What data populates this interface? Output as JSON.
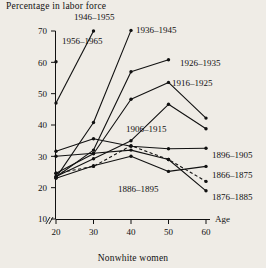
{
  "chart_data": {
    "type": "line",
    "title": "Percentage in labor force",
    "xlabel": "Age",
    "ylabel": "Percentage in labor force",
    "footer": "Nonwhite women",
    "x": [
      20,
      30,
      40,
      50,
      60
    ],
    "xlim": [
      20,
      60
    ],
    "ylim": [
      10,
      70
    ],
    "xticks": [
      20,
      30,
      40,
      50,
      60
    ],
    "yticks": [
      10,
      20,
      30,
      40,
      50,
      60,
      70
    ],
    "xtick_labels": [
      "20",
      "30",
      "40",
      "50",
      "60"
    ],
    "ytick_labels": [
      "10",
      "20",
      "30",
      "40",
      "50",
      "60",
      "70"
    ],
    "grid": false,
    "legend_position": "inline-annotations",
    "axis_break": true,
    "series": [
      {
        "name": "1956–1965",
        "x": [
          20
        ],
        "values": [
          60.2
        ],
        "style": "solid"
      },
      {
        "name": "1946–1955",
        "x": [
          20,
          30
        ],
        "values": [
          47.0,
          70.0
        ],
        "style": "solid"
      },
      {
        "name": "1936–1945",
        "x": [
          20,
          30,
          40
        ],
        "values": [
          23.2,
          40.8,
          70.2
        ],
        "style": "solid"
      },
      {
        "name": "1926–1935",
        "x": [
          20,
          30,
          40,
          50
        ],
        "values": [
          23.4,
          32.0,
          57.0,
          60.8
        ],
        "style": "solid"
      },
      {
        "name": "1916–1925",
        "x": [
          20,
          30,
          40,
          50,
          60
        ],
        "values": [
          24.6,
          30.8,
          48.2,
          53.6,
          42.2
        ],
        "style": "solid"
      },
      {
        "name": "1906–1915",
        "x": [
          20,
          30,
          40,
          50,
          60
        ],
        "values": [
          23.6,
          29.2,
          35.0,
          46.6,
          38.8
        ],
        "style": "solid"
      },
      {
        "name": "1896–1905",
        "x": [
          20,
          30,
          40,
          50,
          60
        ],
        "values": [
          31.6,
          35.6,
          33.2,
          32.4,
          32.6
        ],
        "style": "solid"
      },
      {
        "name": "1886–1895",
        "x": [
          20,
          30,
          40,
          50,
          60
        ],
        "values": [
          24.6,
          26.8,
          33.4,
          29.0,
          22.0
        ],
        "style": "dashed"
      },
      {
        "name": "1876–1885",
        "x": [
          20,
          30,
          40,
          50,
          60
        ],
        "values": [
          30.0,
          31.0,
          32.0,
          29.0,
          19.0
        ],
        "style": "solid"
      },
      {
        "name": "1866–1875",
        "x": [
          20,
          30,
          40,
          50,
          60
        ],
        "values": [
          23.0,
          27.0,
          30.0,
          25.2,
          26.8
        ],
        "style": "solid"
      }
    ],
    "annotations": [
      {
        "label": "1956–1965",
        "x": 62,
        "y": 44,
        "anchor": "start"
      },
      {
        "label": "1946–1955",
        "x": 74,
        "y": 20,
        "anchor": "start"
      },
      {
        "label": "1936–1945",
        "x": 136,
        "y": 33,
        "anchor": "start"
      },
      {
        "label": "1926–1935",
        "x": 180,
        "y": 66,
        "anchor": "start"
      },
      {
        "label": "1916–1925",
        "x": 172,
        "y": 86,
        "anchor": "start"
      },
      {
        "label": "1906–1915",
        "x": 126,
        "y": 132,
        "anchor": "start"
      },
      {
        "label": "1896–1905",
        "x": 212,
        "y": 158,
        "anchor": "start"
      },
      {
        "label": "1866–1875",
        "x": 212,
        "y": 178,
        "anchor": "start"
      },
      {
        "label": "1886–1895",
        "x": 118,
        "y": 192,
        "anchor": "start"
      },
      {
        "label": "1876–1885",
        "x": 212,
        "y": 200,
        "anchor": "start"
      }
    ]
  }
}
